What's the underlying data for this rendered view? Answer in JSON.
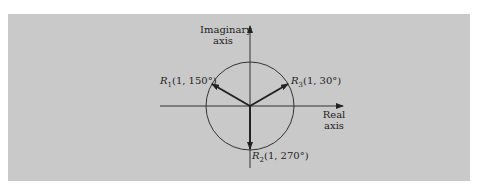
{
  "diagram": {
    "title": "",
    "axes": {
      "vertical_label_line1": "Imaginary",
      "vertical_label_line2": "axis",
      "horizontal_label_line1": "Real",
      "horizontal_label_line2": "axis"
    },
    "unit_circle": {
      "radius": 1
    },
    "phasors": [
      {
        "name": "R",
        "sub": "1",
        "label": "(1, 150°)",
        "magnitude": 1,
        "angle_deg": 150
      },
      {
        "name": "R",
        "sub": "3",
        "label": "(1, 30°)",
        "magnitude": 1,
        "angle_deg": 30
      },
      {
        "name": "R",
        "sub": "2",
        "label": "(1, 270°)",
        "magnitude": 1,
        "angle_deg": 270
      }
    ],
    "colors": {
      "background": "#c9c9c9",
      "ink": "#222222"
    }
  }
}
